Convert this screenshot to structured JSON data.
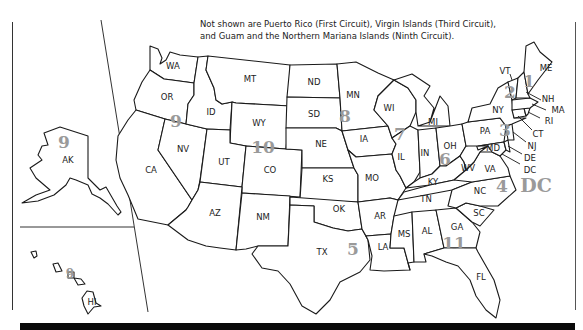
{
  "note": {
    "line1": "Not shown are Puerto Rico (First Circuit), Virgin Islands (Third Circuit),",
    "line2": "and Guam and the Northern Mariana Islands (Ninth Circuit)."
  },
  "colors": {
    "circuit_number": "#9a9a9a",
    "state_border": "#1a1a1a",
    "background": "#ffffff",
    "bottom_bar": "#0a0a0a"
  },
  "states": {
    "WA": "WA",
    "OR": "OR",
    "CA": "CA",
    "NV": "NV",
    "ID": "ID",
    "MT": "MT",
    "WY": "WY",
    "UT": "UT",
    "CO": "CO",
    "AZ": "AZ",
    "NM": "NM",
    "ND": "ND",
    "SD": "SD",
    "NE": "NE",
    "KS": "KS",
    "OK": "OK",
    "TX": "TX",
    "MN": "MN",
    "IA": "IA",
    "MO": "MO",
    "AR": "AR",
    "LA": "LA",
    "WI": "WI",
    "IL": "IL",
    "MS": "MS",
    "MI": "MI",
    "IN": "IN",
    "KY": "KY",
    "TN": "TN",
    "AL": "AL",
    "OH": "OH",
    "WV": "WV",
    "VA": "VA",
    "NC": "NC",
    "SC": "SC",
    "GA": "GA",
    "FL": "FL",
    "PA": "PA",
    "NY": "NY",
    "VT": "VT",
    "NH": "NH",
    "ME": "ME",
    "MA": "MA",
    "RI": "RI",
    "CT": "CT",
    "NJ": "NJ",
    "DE": "DE",
    "MD": "MD",
    "DC": "DC",
    "AK": "AK",
    "HI": "HI"
  },
  "circuits": {
    "c1": "1",
    "c2": "2",
    "c3": "3",
    "c4": "4",
    "c5": "5",
    "c6": "6",
    "c7": "7",
    "c8": "8",
    "c9_west": "9",
    "c9_ak": "9",
    "c9_hi": "9",
    "c10": "10",
    "c11": "11",
    "cdc": "DC"
  }
}
